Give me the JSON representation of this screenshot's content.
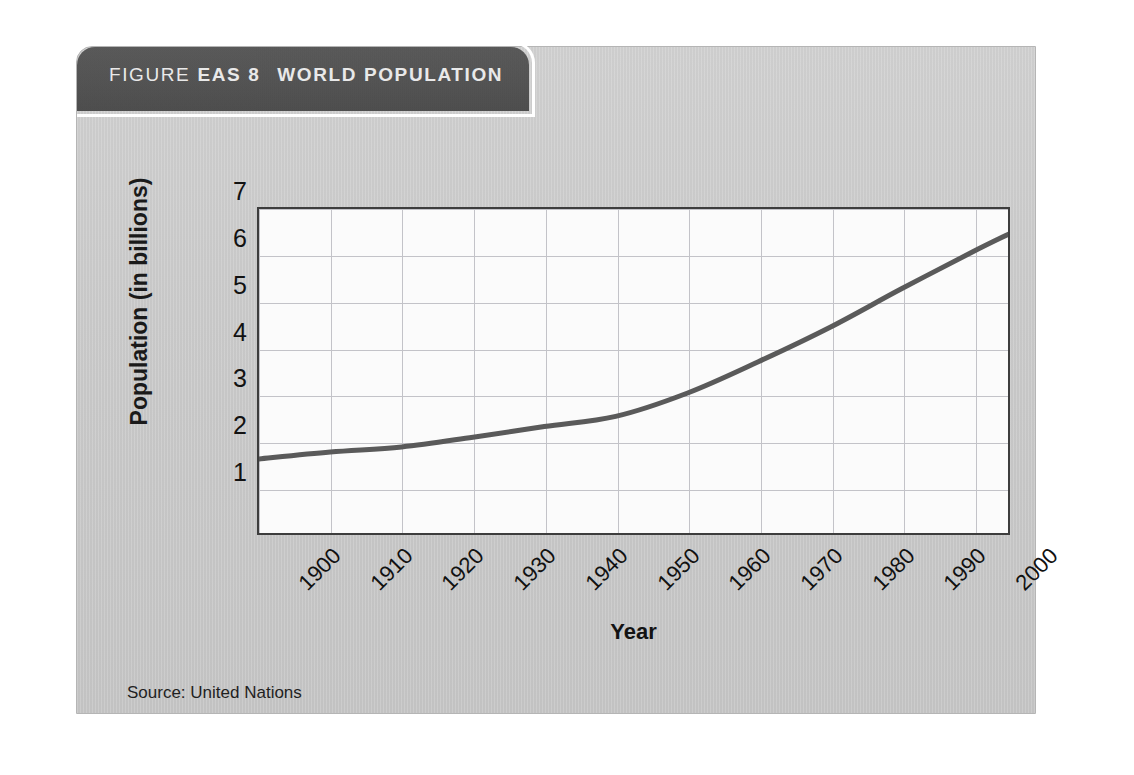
{
  "figure": {
    "header": {
      "label": "FIGURE",
      "code": "EAS 8",
      "title": "WORLD POPULATION"
    },
    "source_note": "Source: United Nations",
    "colors": {
      "header_bar": "#525252",
      "card_background": "#c9c9c9",
      "plot_background": "#fbfbfb",
      "line": "#5a5a5a",
      "grid": "#c3c3c8",
      "axis": "#3d3d3d"
    }
  },
  "chart_data": {
    "type": "line",
    "title": "WORLD POPULATION",
    "xlabel": "Year",
    "ylabel": "Population (in billions)",
    "xlim": [
      1900,
      2005
    ],
    "ylim": [
      0,
      7
    ],
    "grid": true,
    "legend": "none",
    "xticks": [
      "1900",
      "1910",
      "1920",
      "1930",
      "1940",
      "1950",
      "1960",
      "1970",
      "1980",
      "1990",
      "2000"
    ],
    "yticks": [
      "1",
      "2",
      "3",
      "4",
      "5",
      "6",
      "7"
    ],
    "series": [
      {
        "name": "World population",
        "x": [
          1900,
          1910,
          1920,
          1930,
          1940,
          1950,
          1960,
          1970,
          1980,
          1990,
          2000,
          2005
        ],
        "values": [
          1.6,
          1.75,
          1.86,
          2.07,
          2.3,
          2.52,
          3.02,
          3.7,
          4.44,
          5.27,
          6.07,
          6.45
        ]
      }
    ]
  }
}
